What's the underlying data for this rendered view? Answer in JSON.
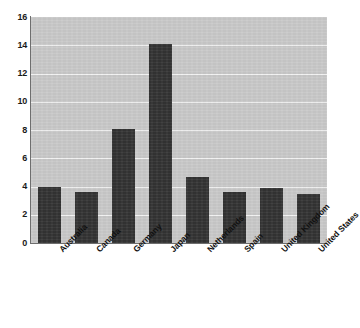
{
  "chart_data": {
    "type": "bar",
    "title": "",
    "subtitle": "",
    "xlabel": "",
    "ylabel": "",
    "categories": [
      "Australia",
      "Canada",
      "Germany",
      "Japan",
      "Netherlands",
      "Spain",
      "United Kingdom",
      "United States"
    ],
    "values": [
      4.0,
      3.6,
      8.1,
      14.1,
      4.65,
      3.6,
      3.9,
      3.5
    ],
    "ylim": [
      0,
      16
    ],
    "ytick_labels": [
      "16",
      "14",
      "12",
      "10",
      "8",
      "6",
      "4",
      "2",
      "0"
    ],
    "ytick_values": [
      16,
      14,
      12,
      10,
      8,
      6,
      4,
      2,
      0
    ],
    "ytick_step": 2,
    "grid": true,
    "grid_axis": "y",
    "legend": false,
    "legend_position": "none",
    "bar_color": "#333333",
    "plot_background_color": "#c9c9c9",
    "figure_background_color": "#ffffff",
    "gridline_color": "#f2f2f2",
    "axis_color": "#6e6e6e",
    "tick_label_color": "#1a1a1a",
    "category_label_rotation": -45
  }
}
